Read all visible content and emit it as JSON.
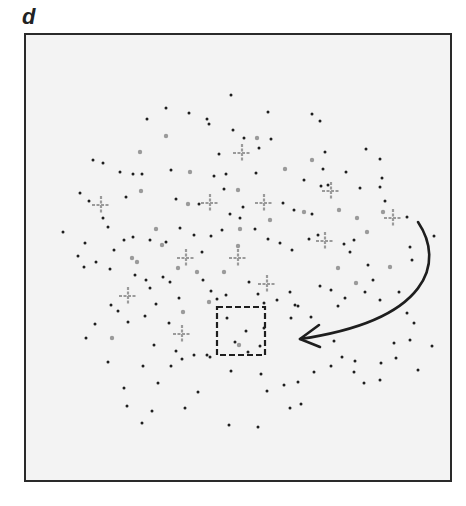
{
  "panel": {
    "label": "d"
  },
  "colors": {
    "frame_border": "#2a2a2a",
    "frame_fill": "#f3f3f3",
    "black_dot": "#1e1e1e",
    "gray_dot": "#9a9a9a",
    "cross": "#9a9a9a",
    "arrow": "#1e1e1e",
    "dashed_box": "#1e1e1e"
  },
  "dashed_box": {
    "x": 217,
    "y": 307,
    "width": 48,
    "height": 48
  },
  "arrow": {
    "start": [
      418,
      222
    ],
    "control1": [
      445,
      262
    ],
    "control2": [
      430,
      320
    ],
    "end": [
      300,
      339
    ]
  },
  "crosses": [
    [
      242,
      153
    ],
    [
      101,
      205
    ],
    [
      210,
      203
    ],
    [
      264,
      203
    ],
    [
      331,
      191
    ],
    [
      393,
      218
    ],
    [
      325,
      241
    ],
    [
      186,
      258
    ],
    [
      238,
      258
    ],
    [
      267,
      284
    ],
    [
      128,
      296
    ],
    [
      182,
      334
    ]
  ],
  "gray_dots": [
    [
      166,
      136
    ],
    [
      140,
      152
    ],
    [
      190,
      172
    ],
    [
      257,
      138
    ],
    [
      312,
      160
    ],
    [
      141,
      191
    ],
    [
      188,
      204
    ],
    [
      238,
      190
    ],
    [
      285,
      169
    ],
    [
      156,
      229
    ],
    [
      162,
      245
    ],
    [
      240,
      229
    ],
    [
      304,
      212
    ],
    [
      178,
      268
    ],
    [
      197,
      272
    ],
    [
      270,
      220
    ],
    [
      132,
      258
    ],
    [
      137,
      262
    ],
    [
      224,
      272
    ],
    [
      238,
      246
    ],
    [
      339,
      210
    ],
    [
      357,
      218
    ],
    [
      383,
      212
    ],
    [
      390,
      267
    ],
    [
      367,
      232
    ],
    [
      112,
      338
    ],
    [
      239,
      345
    ],
    [
      183,
      312
    ],
    [
      209,
      302
    ],
    [
      338,
      268
    ],
    [
      356,
      283
    ]
  ],
  "black_dots": [
    [
      231,
      95
    ],
    [
      166,
      108
    ],
    [
      189,
      113
    ],
    [
      207,
      119
    ],
    [
      147,
      119
    ],
    [
      209,
      124
    ],
    [
      233,
      130
    ],
    [
      268,
      112
    ],
    [
      312,
      114
    ],
    [
      244,
      138
    ],
    [
      271,
      139
    ],
    [
      259,
      148
    ],
    [
      320,
      121
    ],
    [
      325,
      152
    ],
    [
      366,
      149
    ],
    [
      219,
      154
    ],
    [
      93,
      160
    ],
    [
      103,
      163
    ],
    [
      120,
      172
    ],
    [
      133,
      174
    ],
    [
      142,
      174
    ],
    [
      171,
      170
    ],
    [
      256,
      173
    ],
    [
      323,
      169
    ],
    [
      346,
      172
    ],
    [
      380,
      159
    ],
    [
      214,
      176
    ],
    [
      226,
      174
    ],
    [
      224,
      189
    ],
    [
      304,
      180
    ],
    [
      321,
      186
    ],
    [
      328,
      185
    ],
    [
      360,
      188
    ],
    [
      382,
      178
    ],
    [
      380,
      187
    ],
    [
      385,
      201
    ],
    [
      80,
      193
    ],
    [
      89,
      201
    ],
    [
      103,
      218
    ],
    [
      108,
      227
    ],
    [
      126,
      197
    ],
    [
      176,
      199
    ],
    [
      199,
      204
    ],
    [
      230,
      214
    ],
    [
      243,
      207
    ],
    [
      283,
      203
    ],
    [
      294,
      210
    ],
    [
      312,
      214
    ],
    [
      354,
      240
    ],
    [
      368,
      265
    ],
    [
      365,
      292
    ],
    [
      407,
      217
    ],
    [
      410,
      247
    ],
    [
      412,
      260
    ],
    [
      434,
      236
    ],
    [
      63,
      232
    ],
    [
      85,
      243
    ],
    [
      114,
      250
    ],
    [
      124,
      240
    ],
    [
      133,
      237
    ],
    [
      150,
      240
    ],
    [
      166,
      242
    ],
    [
      180,
      228
    ],
    [
      194,
      235
    ],
    [
      202,
      252
    ],
    [
      211,
      236
    ],
    [
      222,
      230
    ],
    [
      240,
      218
    ],
    [
      255,
      229
    ],
    [
      268,
      239
    ],
    [
      280,
      243
    ],
    [
      292,
      250
    ],
    [
      309,
      239
    ],
    [
      318,
      235
    ],
    [
      344,
      244
    ],
    [
      350,
      252
    ],
    [
      78,
      256
    ],
    [
      84,
      267
    ],
    [
      96,
      262
    ],
    [
      110,
      269
    ],
    [
      135,
      275
    ],
    [
      146,
      280
    ],
    [
      150,
      288
    ],
    [
      163,
      277
    ],
    [
      170,
      282
    ],
    [
      179,
      298
    ],
    [
      203,
      280
    ],
    [
      211,
      291
    ],
    [
      217,
      299
    ],
    [
      226,
      295
    ],
    [
      249,
      282
    ],
    [
      258,
      294
    ],
    [
      264,
      303
    ],
    [
      277,
      300
    ],
    [
      290,
      292
    ],
    [
      295,
      305
    ],
    [
      320,
      286
    ],
    [
      331,
      290
    ],
    [
      338,
      306
    ],
    [
      345,
      298
    ],
    [
      373,
      280
    ],
    [
      380,
      300
    ],
    [
      399,
      292
    ],
    [
      407,
      313
    ],
    [
      414,
      323
    ],
    [
      86,
      338
    ],
    [
      95,
      324
    ],
    [
      111,
      305
    ],
    [
      118,
      311
    ],
    [
      128,
      322
    ],
    [
      145,
      316
    ],
    [
      156,
      304
    ],
    [
      169,
      323
    ],
    [
      154,
      345
    ],
    [
      176,
      351
    ],
    [
      182,
      359
    ],
    [
      194,
      355
    ],
    [
      207,
      355
    ],
    [
      227,
      318
    ],
    [
      246,
      331
    ],
    [
      235,
      342
    ],
    [
      260,
      346
    ],
    [
      264,
      328
    ],
    [
      291,
      318
    ],
    [
      298,
      306
    ],
    [
      311,
      317
    ],
    [
      334,
      341
    ],
    [
      342,
      357
    ],
    [
      355,
      361
    ],
    [
      394,
      343
    ],
    [
      396,
      358
    ],
    [
      410,
      340
    ],
    [
      108,
      362
    ],
    [
      124,
      388
    ],
    [
      143,
      366
    ],
    [
      158,
      383
    ],
    [
      171,
      366
    ],
    [
      185,
      408
    ],
    [
      198,
      392
    ],
    [
      210,
      357
    ],
    [
      231,
      371
    ],
    [
      248,
      352
    ],
    [
      261,
      374
    ],
    [
      267,
      391
    ],
    [
      284,
      385
    ],
    [
      298,
      382
    ],
    [
      301,
      404
    ],
    [
      314,
      372
    ],
    [
      331,
      366
    ],
    [
      354,
      372
    ],
    [
      364,
      383
    ],
    [
      381,
      363
    ],
    [
      380,
      380
    ],
    [
      418,
      370
    ],
    [
      432,
      346
    ],
    [
      127,
      406
    ],
    [
      142,
      423
    ],
    [
      152,
      411
    ],
    [
      229,
      425
    ],
    [
      258,
      427
    ],
    [
      290,
      408
    ]
  ]
}
